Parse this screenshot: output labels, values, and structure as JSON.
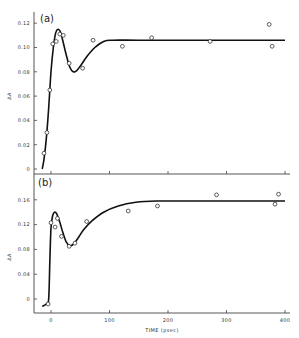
{
  "figure": {
    "xlabel": "TIME (psec)",
    "ylabel": "ΔA"
  },
  "chart_data": [
    {
      "type": "scatter",
      "panel_label": "(a)",
      "title": "",
      "xlabel": "",
      "ylabel": "ΔA",
      "xlim": [
        -30,
        400
      ],
      "ylim": [
        0,
        0.125
      ],
      "x_ticks": [
        0,
        100,
        200,
        300,
        400
      ],
      "x_tick_labels": [],
      "y_ticks": [
        0,
        0.02,
        0.04,
        0.06,
        0.08,
        0.1,
        0.12
      ],
      "y_tick_labels": [
        "0",
        "0.02",
        "0.04",
        "0.06",
        "0.08",
        "0.10",
        "0.12"
      ],
      "grid": false,
      "series": [
        {
          "name": "data",
          "style": "open-circle",
          "points": [
            [
              -12,
              0.013
            ],
            [
              -7,
              0.03
            ],
            [
              -2,
              0.065
            ],
            [
              3,
              0.103
            ],
            [
              9,
              0.105
            ],
            [
              15,
              0.111
            ],
            [
              21,
              0.11
            ],
            [
              31,
              0.087
            ],
            [
              54,
              0.083
            ],
            [
              72,
              0.106
            ],
            [
              122,
              0.101
            ],
            [
              172,
              0.108
            ],
            [
              272,
              0.105
            ],
            [
              373,
              0.119
            ],
            [
              378,
              0.101
            ]
          ]
        },
        {
          "name": "fit",
          "style": "line",
          "points": [
            [
              -15,
              0.0
            ],
            [
              -12,
              0.008
            ],
            [
              -8,
              0.025
            ],
            [
              -4,
              0.05
            ],
            [
              0,
              0.08
            ],
            [
              4,
              0.1
            ],
            [
              8,
              0.112
            ],
            [
              12,
              0.115
            ],
            [
              16,
              0.113
            ],
            [
              20,
              0.106
            ],
            [
              26,
              0.094
            ],
            [
              32,
              0.084
            ],
            [
              38,
              0.08
            ],
            [
              44,
              0.081
            ],
            [
              52,
              0.086
            ],
            [
              62,
              0.093
            ],
            [
              75,
              0.1
            ],
            [
              90,
              0.105
            ],
            [
              105,
              0.106
            ],
            [
              150,
              0.106
            ],
            [
              250,
              0.106
            ],
            [
              400,
              0.106
            ]
          ]
        }
      ]
    },
    {
      "type": "scatter",
      "panel_label": "(b)",
      "title": "",
      "xlabel": "TIME (psec)",
      "ylabel": "ΔA",
      "xlim": [
        -30,
        400
      ],
      "ylim": [
        -0.022,
        0.175
      ],
      "x_ticks": [
        0,
        100,
        200,
        300,
        400
      ],
      "x_tick_labels": [
        "0",
        "100",
        "200",
        "300",
        "400"
      ],
      "y_ticks": [
        0,
        0.04,
        0.08,
        0.12,
        0.16
      ],
      "y_tick_labels": [
        "0",
        "0.04",
        "0.08",
        "0.12",
        "0.16"
      ],
      "grid": false,
      "series": [
        {
          "name": "data",
          "style": "open-circle",
          "points": [
            [
              -5,
              -0.008
            ],
            [
              0,
              0.123
            ],
            [
              7,
              0.116
            ],
            [
              11,
              0.13
            ],
            [
              18,
              0.101
            ],
            [
              31,
              0.085
            ],
            [
              41,
              0.09
            ],
            [
              61,
              0.125
            ],
            [
              132,
              0.142
            ],
            [
              182,
              0.15
            ],
            [
              283,
              0.168
            ],
            [
              383,
              0.153
            ],
            [
              389,
              0.169
            ]
          ]
        },
        {
          "name": "fit",
          "style": "line",
          "points": [
            [
              -15,
              -0.012
            ],
            [
              -8,
              -0.008
            ],
            [
              -4,
              0.0
            ],
            [
              -2,
              0.06
            ],
            [
              0,
              0.115
            ],
            [
              3,
              0.135
            ],
            [
              6,
              0.14
            ],
            [
              10,
              0.137
            ],
            [
              15,
              0.124
            ],
            [
              20,
              0.108
            ],
            [
              26,
              0.092
            ],
            [
              32,
              0.086
            ],
            [
              38,
              0.088
            ],
            [
              46,
              0.098
            ],
            [
              56,
              0.112
            ],
            [
              70,
              0.126
            ],
            [
              90,
              0.14
            ],
            [
              115,
              0.15
            ],
            [
              145,
              0.156
            ],
            [
              180,
              0.158
            ],
            [
              250,
              0.158
            ],
            [
              400,
              0.158
            ]
          ]
        }
      ]
    }
  ]
}
